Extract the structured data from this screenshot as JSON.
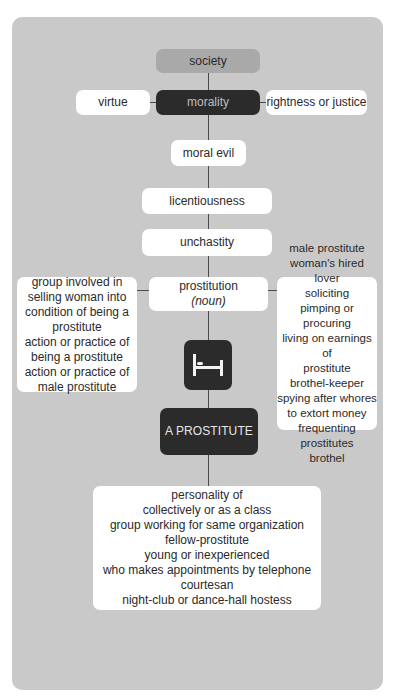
{
  "diagram": {
    "top": {
      "label": "society",
      "color": "#a9a9a9"
    },
    "center": {
      "label": "morality",
      "color": "#2b2b2b"
    },
    "left_of_center": {
      "label": "virtue"
    },
    "right_of_center": {
      "label": "rightness or justice"
    },
    "chain": [
      {
        "label": "moral evil"
      },
      {
        "label": "licentiousness"
      },
      {
        "label": "unchastity"
      }
    ],
    "headword": {
      "label": "prostitution",
      "pos": "(noun)"
    },
    "left_branch": {
      "lines": [
        "group involved in",
        "selling woman into",
        "condition of being a",
        "prostitute",
        "action or practice of",
        "being a prostitute",
        "action or practice of",
        "male prostitute"
      ]
    },
    "right_branch": {
      "lines": [
        "male prostitute",
        "woman's hired lover",
        "soliciting",
        "pimping or procuring",
        "living on earnings of",
        "prostitute",
        "brothel-keeper",
        "spying after whores",
        "to extort money",
        "frequenting prostitutes",
        "brothel"
      ]
    },
    "icon": {
      "name": "bed-icon",
      "color": "#2b2b2b"
    },
    "person": {
      "label": "A PROSTITUTE",
      "color": "#2b2b2b"
    },
    "bottom_branch": {
      "lines": [
        "personality of",
        "collectively or as a class",
        "group working for same organization",
        "fellow-prostitute",
        "young or inexperienced",
        "who makes appointments by telephone",
        "courtesan",
        "night-club or dance-hall hostess"
      ]
    }
  },
  "colors": {
    "panel": "#c9c9c9",
    "box_white": "#ffffff",
    "box_dark": "#2b2b2b",
    "box_mid": "#a9a9a9",
    "connector": "#4a4a4a"
  }
}
